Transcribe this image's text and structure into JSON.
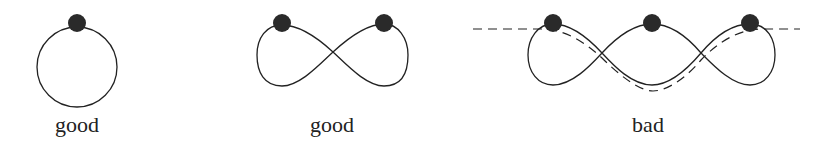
{
  "figures": [
    {
      "id": "circle",
      "label": "good",
      "label_x": 77
    },
    {
      "id": "figure-eight",
      "label": "good",
      "label_x": 332
    },
    {
      "id": "triple-loop",
      "label": "bad",
      "label_x": 648
    }
  ],
  "colors": {
    "stroke": "#222222",
    "dot": "#2a2a2a",
    "background": "#ffffff"
  }
}
